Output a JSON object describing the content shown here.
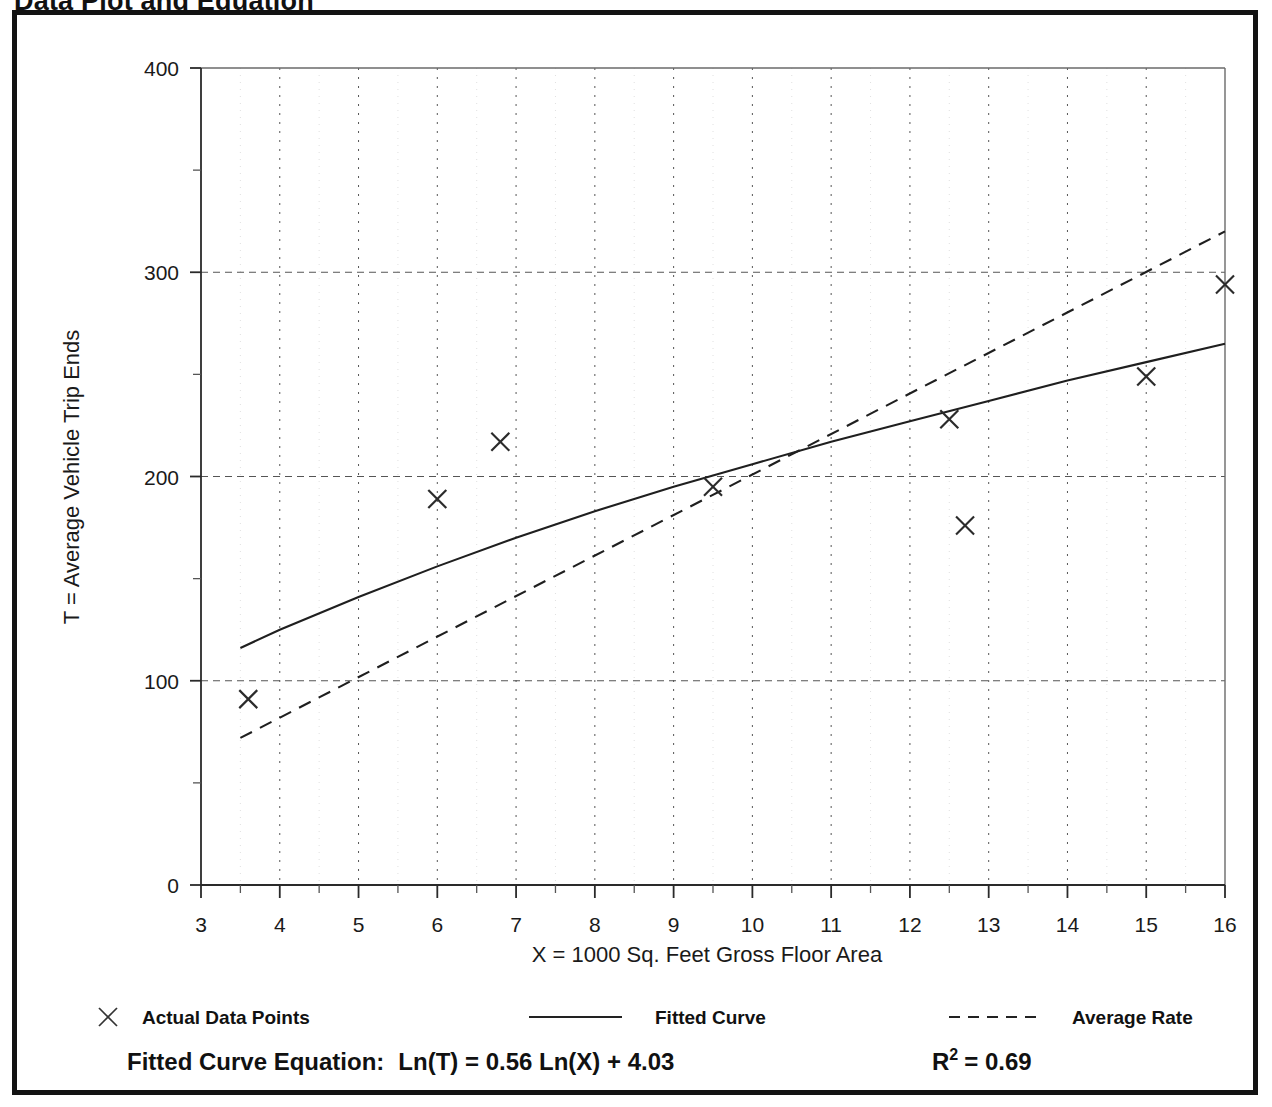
{
  "page": {
    "title": "Data Plot and Equation"
  },
  "chart_data": {
    "type": "scatter",
    "title": "Data Plot and Equation",
    "xlabel": "X = 1000 Sq. Feet Gross Floor Area",
    "ylabel": "T = Average Vehicle Trip Ends",
    "xlim": [
      3,
      16
    ],
    "ylim": [
      0,
      400
    ],
    "xticks": [
      3,
      4,
      5,
      6,
      7,
      8,
      9,
      10,
      11,
      12,
      13,
      14,
      15,
      16
    ],
    "yticks": [
      0,
      100,
      200,
      300,
      400
    ],
    "xminor_step": 0.5,
    "yminor_step": 50,
    "grid": "dotted vertical at each integer x, dashed horizontal at 100/200/300",
    "legend_position": "below-plot",
    "series": [
      {
        "name": "Actual Data Points",
        "type": "scatter",
        "marker": "x",
        "points": [
          {
            "x": 3.6,
            "y": 91
          },
          {
            "x": 6.0,
            "y": 189
          },
          {
            "x": 6.8,
            "y": 217
          },
          {
            "x": 9.5,
            "y": 195
          },
          {
            "x": 12.5,
            "y": 228
          },
          {
            "x": 12.7,
            "y": 176
          },
          {
            "x": 15.0,
            "y": 249
          },
          {
            "x": 16.0,
            "y": 294
          }
        ]
      },
      {
        "name": "Fitted Curve",
        "type": "line",
        "style": "solid",
        "equation": "Ln(T) = 0.56 Ln(X) + 4.03",
        "points": [
          {
            "x": 3.5,
            "y": 116
          },
          {
            "x": 4.0,
            "y": 125
          },
          {
            "x": 5.0,
            "y": 141
          },
          {
            "x": 6.0,
            "y": 156
          },
          {
            "x": 7.0,
            "y": 170
          },
          {
            "x": 8.0,
            "y": 183
          },
          {
            "x": 9.0,
            "y": 195
          },
          {
            "x": 10.0,
            "y": 206
          },
          {
            "x": 11.0,
            "y": 217
          },
          {
            "x": 12.0,
            "y": 227
          },
          {
            "x": 13.0,
            "y": 237
          },
          {
            "x": 14.0,
            "y": 247
          },
          {
            "x": 15.0,
            "y": 256
          },
          {
            "x": 16.0,
            "y": 265
          }
        ]
      },
      {
        "name": "Average Rate",
        "type": "line",
        "style": "dashed",
        "points": [
          {
            "x": 3.5,
            "y": 72
          },
          {
            "x": 16.0,
            "y": 320
          }
        ]
      }
    ]
  },
  "legend": {
    "items": [
      {
        "label": "Actual Data Points",
        "marker": "x-marker"
      },
      {
        "label": "Fitted Curve",
        "marker": "solid-line"
      },
      {
        "label": "Average Rate",
        "marker": "dashed-line"
      }
    ]
  },
  "footer": {
    "equation_label": "Fitted Curve Equation:",
    "equation_value": "Ln(T) = 0.56 Ln(X) + 4.03",
    "r2_symbol": "R",
    "r2_exponent": "2",
    "r2_value": "= 0.69"
  }
}
